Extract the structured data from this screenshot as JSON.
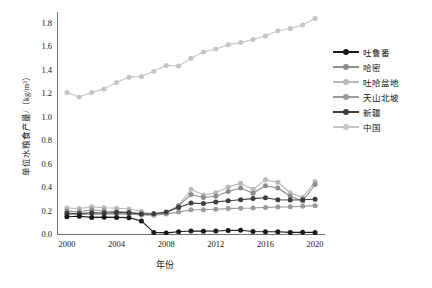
{
  "chart_data": {
    "type": "line",
    "title": "",
    "xlabel": "年份",
    "ylabel": "单位水粮食产量/（kg/m³）",
    "xlim": [
      1999.2,
      2020.8
    ],
    "ylim": [
      0.0,
      1.9
    ],
    "grid": false,
    "legend_position": "right",
    "x": [
      2000,
      2001,
      2002,
      2003,
      2004,
      2005,
      2006,
      2007,
      2008,
      2009,
      2010,
      2011,
      2012,
      2013,
      2014,
      2015,
      2016,
      2017,
      2018,
      2019,
      2020
    ],
    "xticks": [
      "2000",
      "2004",
      "2008",
      "2012",
      "2016",
      "2020"
    ],
    "xtick_values": [
      2000,
      2004,
      2008,
      2012,
      2016,
      2020
    ],
    "yticks": [
      "0.0",
      "0.2",
      "0.4",
      "0.6",
      "0.8",
      "1.0",
      "1.2",
      "1.4",
      "1.6",
      "1.8"
    ],
    "ytick_values": [
      0.0,
      0.2,
      0.4,
      0.6,
      0.8,
      1.0,
      1.2,
      1.4,
      1.6,
      1.8
    ],
    "series": [
      {
        "name": "吐鲁番",
        "color": "#1a1a1a",
        "values": [
          0.155,
          0.16,
          0.15,
          0.152,
          0.15,
          0.148,
          0.12,
          0.022,
          0.018,
          0.028,
          0.034,
          0.033,
          0.034,
          0.038,
          0.04,
          0.03,
          0.028,
          0.028,
          0.022,
          0.024,
          0.022
        ]
      },
      {
        "name": "哈密",
        "color": "#8c8c8c",
        "values": [
          0.205,
          0.198,
          0.215,
          0.205,
          0.2,
          0.195,
          0.182,
          0.18,
          0.19,
          0.25,
          0.345,
          0.32,
          0.33,
          0.37,
          0.4,
          0.355,
          0.42,
          0.4,
          0.33,
          0.29,
          0.43
        ]
      },
      {
        "name": "吐哈盆地",
        "color": "#b8b8b8",
        "values": [
          0.23,
          0.225,
          0.24,
          0.232,
          0.228,
          0.222,
          0.2,
          0.175,
          0.185,
          0.25,
          0.39,
          0.34,
          0.36,
          0.41,
          0.44,
          0.39,
          0.47,
          0.45,
          0.36,
          0.32,
          0.455
        ]
      },
      {
        "name": "天山北坡",
        "color": "#9a9a9a",
        "values": [
          0.175,
          0.172,
          0.18,
          0.178,
          0.18,
          0.178,
          0.17,
          0.168,
          0.178,
          0.195,
          0.215,
          0.215,
          0.22,
          0.225,
          0.228,
          0.23,
          0.235,
          0.238,
          0.24,
          0.245,
          0.25
        ]
      },
      {
        "name": "新疆",
        "color": "#3d3d3d",
        "values": [
          0.185,
          0.182,
          0.19,
          0.188,
          0.192,
          0.19,
          0.178,
          0.18,
          0.195,
          0.235,
          0.272,
          0.268,
          0.282,
          0.292,
          0.3,
          0.31,
          0.318,
          0.3,
          0.298,
          0.3,
          0.305
        ]
      },
      {
        "name": "中国",
        "color": "#c4c4c4",
        "values": [
          1.215,
          1.175,
          1.215,
          1.245,
          1.3,
          1.345,
          1.35,
          1.395,
          1.445,
          1.44,
          1.505,
          1.56,
          1.585,
          1.62,
          1.64,
          1.665,
          1.695,
          1.74,
          1.76,
          1.79,
          1.845
        ]
      }
    ]
  },
  "axes": {
    "ylabel": "单位水粮食产量/（kg/m³）",
    "xlabel": "年份"
  },
  "legend": {
    "items": [
      {
        "label": "吐鲁番"
      },
      {
        "label": "哈密"
      },
      {
        "label": "吐哈盆地"
      },
      {
        "label": "天山北坡"
      },
      {
        "label": "新疆"
      },
      {
        "label": "中国"
      }
    ]
  },
  "caption": ""
}
